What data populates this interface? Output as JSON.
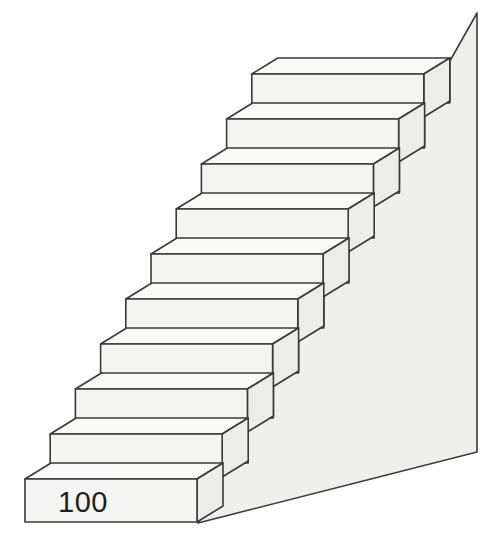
{
  "figure": {
    "kind": "isometric-staircase",
    "step_count": 10,
    "background_color": "#ffffff",
    "outline_color": "#3a3a3a",
    "front_face_color": "#f4f4f2",
    "top_face_color": "#fafaf9",
    "end_face_color": "#ececea",
    "side_panel_color": "#efefed"
  },
  "labels": {
    "bottom_step_value": "100"
  },
  "geometry": {
    "origin": {
      "x": 25,
      "y": 522
    },
    "step_run": 25.2,
    "step_rise": 45.0,
    "front_width": 172,
    "front_height": 43,
    "depth_dx": 26,
    "depth_dy": -16,
    "panel_top_right": {
      "x": 477,
      "y": 13
    },
    "panel_bottom_right": {
      "x": 477,
      "y": 452
    },
    "panel_bottom_left": {
      "x": 198,
      "y": 523
    }
  },
  "steps": [
    {
      "index": 1,
      "label": "100"
    },
    {
      "index": 2,
      "label": ""
    },
    {
      "index": 3,
      "label": ""
    },
    {
      "index": 4,
      "label": ""
    },
    {
      "index": 5,
      "label": ""
    },
    {
      "index": 6,
      "label": ""
    },
    {
      "index": 7,
      "label": ""
    },
    {
      "index": 8,
      "label": ""
    },
    {
      "index": 9,
      "label": ""
    },
    {
      "index": 10,
      "label": ""
    }
  ]
}
